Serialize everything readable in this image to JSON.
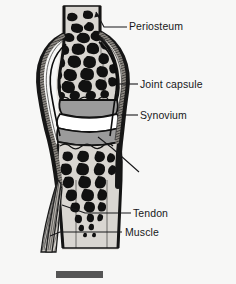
{
  "figure": {
    "background_color": "#f7f7f6",
    "ink_color": "#18181a",
    "width": 236,
    "height": 284
  },
  "labels": {
    "periosteum": "Periosteum",
    "joint_capsule": "Joint capsule",
    "synovium": "Synovium",
    "articular_cartilage_line1": "Articular",
    "articular_cartilage_line2": "cartilage",
    "tendon": "Tendon",
    "muscle": "Muscle"
  },
  "scale_bar": {
    "name": "scale-bar",
    "color": "#555555",
    "x": 56,
    "y": 271,
    "width": 47,
    "height": 7
  },
  "anatomy": {
    "bone_marrow_fill": "#d9d6d1",
    "trabeculae_color": "#101010",
    "cortical_bone_color": "#141414",
    "cartilage_fill": "#9a9a9a",
    "joint_space_fill": "#ffffff",
    "capsule_fill": "#6e6e6e",
    "muscle_hatch_color": "#3a3a3a",
    "parts": [
      "periosteum",
      "joint capsule",
      "synovium",
      "articular cartilage",
      "tendon",
      "muscle",
      "trabecular bone",
      "cortical bone",
      "joint space"
    ]
  },
  "leaders": {
    "periosteum": "arrow",
    "joint_capsule": "line",
    "synovium": "line",
    "articular_cartilage": "line",
    "tendon": "line",
    "muscle": "line"
  }
}
